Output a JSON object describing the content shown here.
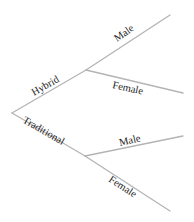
{
  "diagram": {
    "type": "tree",
    "line_color": "#b4b4b4",
    "text_color": "#222222",
    "root": {
      "point": [
        12,
        113
      ]
    },
    "branches": [
      {
        "label": "Hybrid",
        "from": [
          12,
          113
        ],
        "to": [
          86,
          70
        ],
        "children": [
          {
            "label": "Male",
            "from": [
              86,
              70
            ],
            "to": [
              170,
              15
            ]
          },
          {
            "label": "Female",
            "from": [
              86,
              70
            ],
            "to": [
              183,
              93
            ]
          }
        ]
      },
      {
        "label": "Traditional",
        "from": [
          12,
          113
        ],
        "to": [
          85,
          156
        ],
        "children": [
          {
            "label": "Male",
            "from": [
              85,
              156
            ],
            "to": [
              183,
              136
            ]
          },
          {
            "label": "Female",
            "from": [
              85,
              156
            ],
            "to": [
              170,
              211
            ]
          }
        ]
      }
    ]
  }
}
